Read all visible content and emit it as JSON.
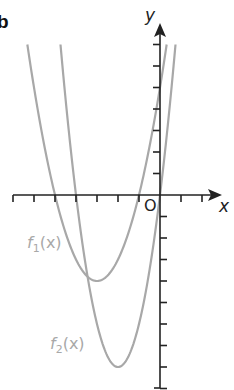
{
  "part_label": "b",
  "axes": {
    "x_label": "x",
    "y_label": "y",
    "origin_label": "O",
    "x_ticks": [
      -7,
      -6,
      -5,
      -4,
      -3,
      -2,
      -1,
      0,
      1,
      2
    ],
    "y_ticks_above": [
      1,
      2,
      3,
      4,
      5,
      6,
      7
    ],
    "y_ticks_below": [
      -1,
      -2,
      -3,
      -4,
      -5,
      -6,
      -7,
      -8,
      -9
    ]
  },
  "functions": [
    {
      "name": "f",
      "subscript": "1",
      "arg": "(x)",
      "roots": [
        -5,
        -1
      ],
      "vertex": [
        -3,
        -4
      ],
      "color": "#a8a8a8"
    },
    {
      "name": "f",
      "subscript": "2",
      "arg": "(x)",
      "roots": [
        -4,
        0
      ],
      "vertex": [
        -2,
        -8
      ],
      "color": "#a8a8a8"
    }
  ],
  "colors": {
    "axis": "#222222",
    "curve": "#a8a8a8",
    "label": "#a8a8a8"
  }
}
